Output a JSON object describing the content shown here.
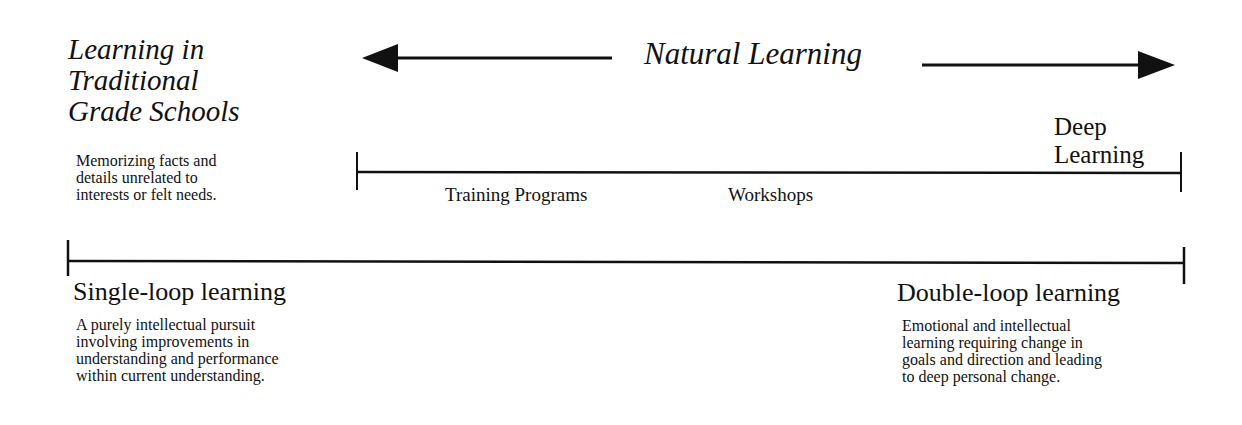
{
  "traditional": {
    "title_lines": [
      "Learning in",
      "Traditional",
      "Grade Schools"
    ],
    "description_lines": [
      "Memorizing facts and",
      "details unrelated to",
      "interests or felt needs."
    ]
  },
  "natural_learning": {
    "label": "Natural Learning",
    "arrow_left": "arrow-left",
    "arrow_right": "arrow-right"
  },
  "scale_top": {
    "end_label_lines": [
      "Deep",
      "Learning"
    ],
    "markers": [
      "Training Programs",
      "Workshops"
    ]
  },
  "scale_bottom": {
    "left": {
      "title": "Single-loop learning",
      "description_lines": [
        "A purely intellectual pursuit",
        "involving improvements in",
        "understanding and performance",
        "within current understanding."
      ]
    },
    "right": {
      "title": "Double-loop learning",
      "description_lines": [
        "Emotional and intellectual",
        "learning requiring change in",
        "goals and direction and leading",
        "to deep personal change."
      ]
    }
  },
  "colors": {
    "ink": "#111111",
    "background": "#ffffff"
  }
}
